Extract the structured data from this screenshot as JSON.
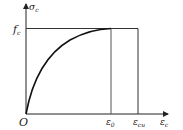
{
  "diagram": {
    "y_axis_label": "σ",
    "y_axis_sub": "c",
    "x_axis_label": "ε",
    "x_axis_sub": "c",
    "origin_label": "O",
    "peak_stress_label": "f",
    "peak_stress_sub": "c",
    "peak_strain_label": "ε",
    "peak_strain_sub": "0",
    "ultimate_strain_label": "ε",
    "ultimate_strain_sub": "cu",
    "colors": {
      "line": "#222222",
      "guide": "#555555",
      "background": "#ffffff"
    }
  }
}
